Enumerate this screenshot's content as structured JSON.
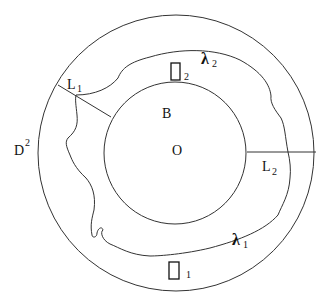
{
  "diagram": {
    "type": "annulus-with-curves",
    "outer_disk": {
      "label": "D",
      "superscript": "2"
    },
    "inner_disk": {
      "label": "B",
      "center_label": "O"
    },
    "curves": [
      {
        "name": "lambda-1",
        "symbol": "λ",
        "subscript": "1"
      },
      {
        "name": "lambda-2",
        "symbol": "λ",
        "subscript": "2"
      }
    ],
    "segments": [
      {
        "name": "L1",
        "label": "L",
        "subscript": "1"
      },
      {
        "name": "L2",
        "label": "L",
        "subscript": "2"
      }
    ],
    "regions": [
      {
        "name": "box-1",
        "symbol": "□",
        "subscript": "1"
      },
      {
        "name": "box-2",
        "symbol": "□",
        "subscript": "2"
      }
    ],
    "colors": {
      "stroke": "#333333",
      "text": "#111111",
      "background": "#ffffff"
    }
  }
}
